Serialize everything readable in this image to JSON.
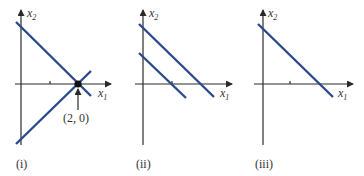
{
  "colors": {
    "line": "#2b4a8c",
    "axis": "#2a2a2a",
    "point": "#111111",
    "text": "#333333"
  },
  "axes": {
    "x_label": "x",
    "x_sub": "1",
    "y_label": "x",
    "y_sub": "2"
  },
  "panels": [
    {
      "caption": "(i)",
      "description": "Two lines intersecting at a single point on the x1 axis",
      "point_label": "(2, 0)"
    },
    {
      "caption": "(ii)",
      "description": "Two parallel lines with negative slope"
    },
    {
      "caption": "(iii)",
      "description": "A single line with negative slope"
    }
  ]
}
